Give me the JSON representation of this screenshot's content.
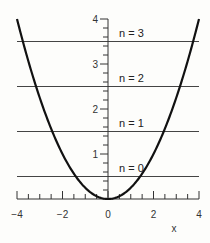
{
  "chart_data": {
    "type": "line",
    "title": "",
    "xlabel": "x",
    "ylabel": "",
    "xlim": [
      -4,
      4
    ],
    "ylim": [
      0,
      4
    ],
    "x_ticks": [
      -4,
      -2,
      0,
      2,
      4
    ],
    "y_ticks": [
      1,
      2,
      3,
      4
    ],
    "x_minor_step": 0.5,
    "y_minor_step": 0.2,
    "grid": false,
    "series": [
      {
        "name": "potential",
        "function": "y = x^2 / 4",
        "x": [
          -4,
          -3,
          -2,
          -1,
          0,
          1,
          2,
          3,
          4
        ],
        "y": [
          4,
          2.25,
          1,
          0.25,
          0,
          0.25,
          1,
          2.25,
          4
        ],
        "color": "#111111"
      }
    ],
    "levels": [
      {
        "label": "n = 0",
        "y": 0.5
      },
      {
        "label": "n = 1",
        "y": 1.5
      },
      {
        "label": "n = 2",
        "y": 2.5
      },
      {
        "label": "n = 3",
        "y": 3.5
      }
    ],
    "colors": {
      "curve": "#111111",
      "levels": "#444444",
      "axis": "#333333"
    }
  }
}
